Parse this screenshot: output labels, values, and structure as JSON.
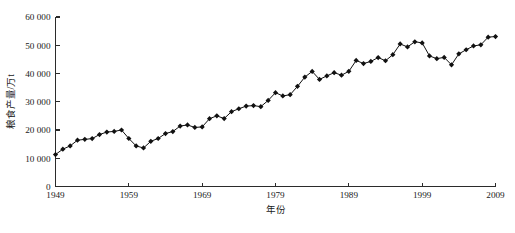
{
  "chart_data": {
    "type": "line",
    "title": "",
    "xlabel": "年份",
    "ylabel": "粮食产量/万t",
    "xlim": [
      1949,
      2009
    ],
    "ylim": [
      0,
      60000
    ],
    "grid": false,
    "legend": null,
    "marker": "diamond",
    "xticks": [
      "1949",
      "1959",
      "1969",
      "1979",
      "1989",
      "1999",
      "2009"
    ],
    "xtick_values": [
      1949,
      1959,
      1969,
      1979,
      1989,
      1999,
      2009
    ],
    "yticks": [
      "0",
      "10 000",
      "20 000",
      "30 000",
      "40 000",
      "50 000",
      "60 000"
    ],
    "ytick_values": [
      0,
      10000,
      20000,
      30000,
      40000,
      50000,
      60000
    ],
    "x": [
      1949,
      1950,
      1951,
      1952,
      1953,
      1954,
      1955,
      1956,
      1957,
      1958,
      1959,
      1960,
      1961,
      1962,
      1963,
      1964,
      1965,
      1966,
      1967,
      1968,
      1969,
      1970,
      1971,
      1972,
      1973,
      1974,
      1975,
      1976,
      1977,
      1978,
      1979,
      1980,
      1981,
      1982,
      1983,
      1984,
      1985,
      1986,
      1987,
      1988,
      1989,
      1990,
      1991,
      1992,
      1993,
      1994,
      1995,
      1996,
      1997,
      1998,
      1999,
      2000,
      2001,
      2002,
      2003,
      2004,
      2005,
      2006,
      2007,
      2008,
      2009
    ],
    "values": [
      11318,
      13213,
      14369,
      16392,
      16683,
      16952,
      18394,
      19275,
      19505,
      20000,
      17000,
      14350,
      13650,
      16000,
      17000,
      18750,
      19453,
      21400,
      21782,
      20905,
      21097,
      23996,
      25014,
      24048,
      26494,
      27527,
      28452,
      28631,
      28273,
      30477,
      33212,
      32056,
      32502,
      35450,
      38728,
      40731,
      37911,
      39151,
      40298,
      39408,
      40755,
      44624,
      43529,
      44266,
      45649,
      44510,
      46662,
      50454,
      49417,
      51230,
      50839,
      46218,
      45264,
      45706,
      43070,
      46947,
      48402,
      49748,
      50160,
      52871,
      53082
    ],
    "series_name": "粮食产量"
  },
  "figure": {
    "caption": ""
  }
}
